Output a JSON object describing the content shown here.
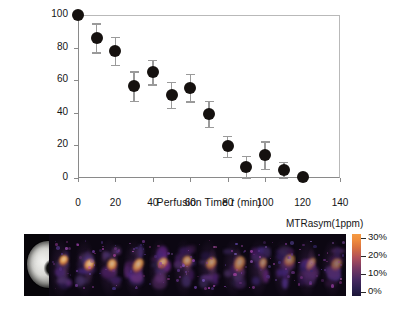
{
  "figure": {
    "title": ""
  },
  "chart_data": {
    "type": "scatter",
    "title": "",
    "xlabel": "Perfusion Time t (min)",
    "xlabel_prefix": "Perfusion Time ",
    "xlabel_italic": "t",
    "xlabel_suffix": " (min)",
    "ylabel": "Glycogen CEST Signal (%)",
    "xlim": [
      0,
      140
    ],
    "ylim": [
      0,
      100
    ],
    "xticks": [
      0,
      20,
      40,
      60,
      80,
      100,
      120,
      140
    ],
    "yticks": [
      0,
      20,
      40,
      60,
      80,
      100
    ],
    "grid": false,
    "legend": null,
    "marker": "filled-circle",
    "marker_color": "#15110f",
    "errorbar_color": "#9a9a9a",
    "x": [
      0,
      10,
      20,
      30,
      40,
      50,
      60,
      70,
      80,
      90,
      100,
      110,
      120
    ],
    "y": [
      100.0,
      86.0,
      78.0,
      56.5,
      65.0,
      51.0,
      55.5,
      39.5,
      19.5,
      7.0,
      14.0,
      5.0,
      0.5
    ],
    "yerr": [
      0.0,
      9.0,
      8.5,
      9.0,
      7.5,
      8.0,
      8.5,
      8.0,
      6.5,
      6.5,
      8.5,
      5.0,
      0.0
    ]
  },
  "imagestrip": {
    "colorbar": {
      "title": "MTRasym(1ppm)",
      "ticks": [
        "30%",
        "20%",
        "10%",
        "0%"
      ],
      "tick_values": [
        30,
        20,
        10,
        0
      ],
      "vmin": 0,
      "vmax": 30,
      "color_low": "#1b1436",
      "color_mid": "#7a3a63",
      "color_high": "#f59a42"
    },
    "panel_count": 13,
    "first_panel": "anatomical-reference"
  }
}
